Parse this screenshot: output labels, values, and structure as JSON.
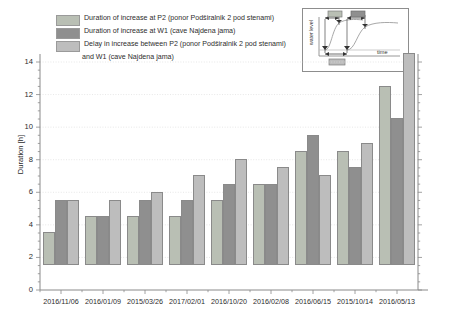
{
  "legend": {
    "items": [
      {
        "name": "legend-p2",
        "label": "Duration of increase at P2 (ponor Podširalnik 2 pod stenami)",
        "color": "#b9bfb4"
      },
      {
        "name": "legend-w1",
        "label": "Duration of increase at W1 (cave Najdena jama)",
        "color": "#8f8f8f"
      },
      {
        "name": "legend-delay",
        "label": "Delay in increase between P2 (ponor Podširalnik 2 pod stenami)",
        "label_line2": "and W1 (cave Najdena jama)",
        "color": "#bdbdbd"
      }
    ]
  },
  "inset": {
    "ylabel": "water level",
    "xlabel": "time"
  },
  "chart_data": {
    "type": "bar",
    "title": "",
    "xlabel": "",
    "ylabel": "Duration [h]",
    "ylim": [
      0,
      14
    ],
    "ytick_step": 2,
    "yticks": [
      "0",
      "2",
      "4",
      "6",
      "8",
      "10",
      "12",
      "14"
    ],
    "grid": true,
    "legend_position": "top-left",
    "categories": [
      "2016/11/06",
      "2016/01/09",
      "2015/03/26",
      "2017/02/01",
      "2016/10/20",
      "2016/02/08",
      "2016/06/15",
      "2015/10/14",
      "2016/05/13"
    ],
    "series": [
      {
        "name": "Duration of increase at P2 (ponor Podširalnik 2 pod stenami)",
        "color": "#b9bfb4",
        "values": [
          2,
          3,
          3,
          3,
          4,
          5,
          7,
          7,
          11
        ]
      },
      {
        "name": "Duration of increase at W1 (cave Najdena jama)",
        "color": "#8f8f8f",
        "values": [
          4,
          3,
          4,
          4,
          5,
          5,
          8,
          6,
          9
        ]
      },
      {
        "name": "Delay in increase between P2 (ponor Podširalnik 2 pod stenami) and W1 (cave Najdena jama)",
        "color": "#bdbdbd",
        "values": [
          4,
          4,
          4.5,
          5.5,
          6.5,
          6,
          5.5,
          7.5,
          13
        ]
      }
    ]
  }
}
